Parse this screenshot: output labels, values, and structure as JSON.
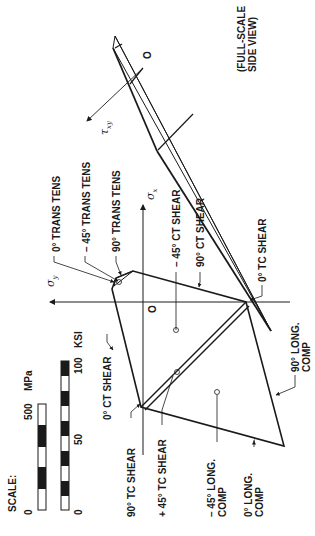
{
  "scale": {
    "title": "SCALE:",
    "mpa_ticks": [
      "0",
      "500"
    ],
    "mpa_unit": "MPa",
    "ksi_ticks": [
      "0",
      "50",
      "100"
    ],
    "ksi_unit": "KSI"
  },
  "axes": {
    "sigma_x": "σ",
    "sigma_x_sub": "x",
    "sigma_y": "σ",
    "sigma_y_sub": "y",
    "tau": "τ",
    "tau_sub": "xy",
    "origin": "O",
    "origin_side": "O"
  },
  "side_view": {
    "line1": "(FULL-SCALE",
    "line2": "SIDE VIEW)"
  },
  "labels": {
    "trans_tens_0": "0° TRANS TENS",
    "trans_tens_m45": "– 45° TRANS TENS",
    "trans_tens_90": "90° TRANS TENS",
    "ct_shear_m45": "– 45° CT SHEAR",
    "ct_shear_90": "90° CT SHEAR",
    "tc_shear_0": "0° TC SHEAR",
    "ct_shear_0": "0° CT SHEAR",
    "tc_shear_90": "90° TC SHEAR",
    "tc_shear_p45": "+ 45° TC SHEAR",
    "long_comp_m45_l1": "– 45° LONG.",
    "long_comp_m45_l2": "COMP",
    "long_comp_0_l1": "0° LONG.",
    "long_comp_0_l2": "COMP",
    "long_comp_90_l1": "90° LONG.",
    "long_comp_90_l2": "COMP"
  }
}
